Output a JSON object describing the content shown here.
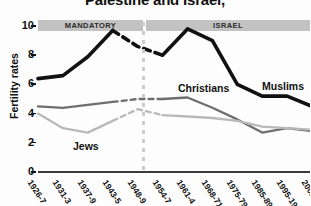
{
  "chart_data": {
    "type": "line",
    "title": "Palestine and Israel,",
    "ylabel": "Fertility rates",
    "xlabel": "",
    "ylim": [
      0,
      10.6
    ],
    "yticks": [
      "0",
      "2",
      "4",
      "6",
      "8",
      "10"
    ],
    "grid": false,
    "legend_position": "inline-annotations",
    "categories": [
      "1926-7",
      "1931-3",
      "1937-9",
      "1943-5",
      "1948-9",
      "1954-7",
      "1961-4",
      "1968-71",
      "1975-79",
      "1985-89",
      "1995-1999",
      "2002"
    ],
    "x": [
      "1926-7",
      "1931-3",
      "1937-9",
      "1943-5",
      "1948-9",
      "1954-7",
      "1961-4",
      "1968-71",
      "1975-79",
      "1985-89",
      "1995-1999",
      "2002"
    ],
    "series": [
      {
        "name": "Muslims",
        "color": "#111111",
        "values": [
          6.4,
          6.6,
          7.9,
          9.7,
          8.6,
          8.0,
          9.8,
          9.0,
          6.0,
          5.2,
          5.2,
          4.5
        ]
      },
      {
        "name": "Christians",
        "color": "#6e6e6e",
        "values": [
          4.5,
          4.4,
          4.6,
          4.8,
          5.0,
          5.0,
          5.1,
          4.4,
          3.6,
          2.7,
          3.0,
          2.8
        ]
      },
      {
        "name": "Jews",
        "color": "#b9b9b9",
        "values": [
          4.0,
          3.0,
          2.7,
          3.5,
          4.3,
          3.9,
          3.8,
          3.7,
          3.5,
          3.1,
          3.0,
          2.9
        ]
      }
    ],
    "annotations": [
      {
        "text": "MANDATORY",
        "type": "period-band"
      },
      {
        "text": "ISRAEL",
        "type": "period-band"
      },
      {
        "text": "Muslims",
        "type": "series-label"
      },
      {
        "text": "Christians",
        "type": "series-label"
      },
      {
        "text": "Jews",
        "type": "series-label"
      }
    ]
  },
  "bands": {
    "mandatory": "MANDATORY",
    "israel": "ISRAEL"
  },
  "labels": {
    "muslims": "Muslims",
    "christians": "Christians",
    "jews": "Jews"
  }
}
